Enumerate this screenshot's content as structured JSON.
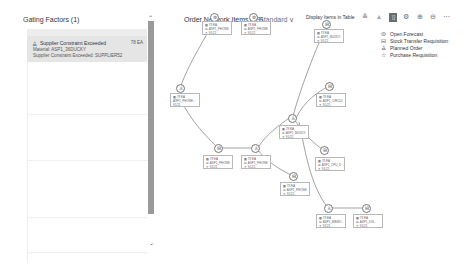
{
  "left_panel": {
    "title": "Gating Factors (1)",
    "items": [
      {
        "icon": "factory-icon",
        "title": "Supplier Constraint Exceeded",
        "value": "78 EA",
        "material": "Material: ASP1_36DUCKY",
        "detail": "Supplier Constraint Exceeded: SUPPLIER52"
      }
    ]
  },
  "main": {
    "title": "Order Network Items (19)",
    "variant": "Standard",
    "display_in_table": "Display Items in Table",
    "toolbar_icons": [
      "collapse-icon",
      "expand-icon",
      "network-view-icon",
      "settings-icon",
      "zoom-in-icon",
      "zoom-out-icon",
      "more-icon"
    ]
  },
  "legend": [
    {
      "icon": "open-forecast-icon",
      "glyph": "⊜",
      "label": "Open Forecast"
    },
    {
      "icon": "stock-transfer-icon",
      "glyph": "⊟",
      "label": "Stock Transfer Requisition"
    },
    {
      "icon": "planned-order-icon",
      "glyph": "♙",
      "label": "Planned Order"
    },
    {
      "icon": "purchase-requisition-icon",
      "glyph": "☆",
      "label": "Purchase Requisition"
    }
  ],
  "nodes": [
    {
      "id": "A",
      "glyph": "⊜",
      "lines": [
        "▦ 78 EA",
        "⊟ ASP1_PHONE...",
        "✦ 91/21"
      ]
    },
    {
      "id": "B",
      "glyph": "⊜",
      "lines": [
        "▦ 78 EA",
        "⊟ ASP1_PHONE...",
        "✦ 91/21"
      ]
    },
    {
      "id": "C",
      "glyph": "⊟",
      "lines": [
        "▦ 78 EA",
        "⊟ ASP1_BUDDY...",
        "✦ 91/21"
      ]
    },
    {
      "id": "D",
      "glyph": "♙",
      "lines": [
        "▦ 78 EA",
        "ASP1_PHONE...",
        "91/21"
      ]
    },
    {
      "id": "E",
      "glyph": "⊟",
      "lines": [
        "▦ 78 EA",
        "⊟ ASP1_CIRCUI...",
        "✦ 91/21"
      ]
    },
    {
      "id": "F",
      "glyph": "♙",
      "lines": [
        "▦ 78 EA",
        "⊟ ASP1_BUDDY...",
        "✦ 91/21"
      ]
    },
    {
      "id": "G",
      "glyph": "⊟",
      "lines": [
        "▦ 78 EA",
        "⊟ ASP1_CPU_D",
        "✦ 91/21"
      ]
    },
    {
      "id": "H",
      "glyph": "⊟",
      "lines": [
        "▦ 78 EA",
        "⊟ ASP1_PHONE...",
        "✦ 91/21"
      ]
    },
    {
      "id": "I",
      "glyph": "♙",
      "lines": [
        "▦ 78 EA",
        "⊟ ASP1_PHONE...",
        "✦ 91/21"
      ]
    },
    {
      "id": "J",
      "glyph": "⊟",
      "lines": [
        "▦ 78 EA",
        "⊟ ASP1_PHONE...",
        "✦ 91/21"
      ]
    },
    {
      "id": "K",
      "glyph": "♙",
      "lines": [
        "▦ 78 EA",
        "⊟ ASP1_MEMO...",
        "✦ 91/21"
      ]
    },
    {
      "id": "L",
      "glyph": "⊟",
      "lines": [
        "▦ 78 EA",
        "⊟ ASP1_DIS...",
        "✦ 91/21"
      ]
    }
  ]
}
